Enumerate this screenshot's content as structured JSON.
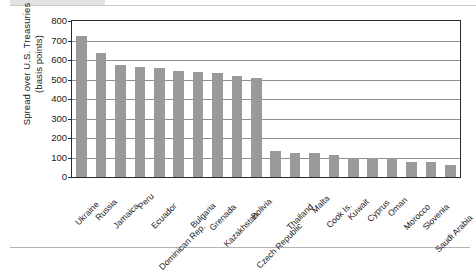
{
  "chart_data": {
    "type": "bar",
    "title": "",
    "subtitle": "",
    "xlabel": "",
    "ylabel": "Spread over U.S. Treasuries\n(basis points)",
    "ylim": [
      0,
      800
    ],
    "ytick_step": 100,
    "yticks": [
      "800",
      "700",
      "600",
      "500",
      "400",
      "300",
      "200",
      "100",
      "0"
    ],
    "grid": true,
    "grid_axis": "y",
    "legend": false,
    "legend_position": "none",
    "bar_color": "#9a9a9a",
    "axis_color": "#2b2b2b",
    "categories": [
      "Ukraine",
      "Russia",
      "Jamaica",
      "Peru",
      "Ecuador",
      "Dominican Rep.",
      "Bulgaria",
      "Grenada",
      "Kazakhstan",
      "Bolivia",
      "Czech Republic",
      "Thailand",
      "Malta",
      "Cook Is.",
      "Kuwait",
      "Cyprus",
      "Oman",
      "Morocco",
      "Slovenia",
      "Saudi Arabia"
    ],
    "values": [
      725,
      635,
      572,
      563,
      558,
      545,
      540,
      531,
      517,
      510,
      133,
      125,
      125,
      113,
      98,
      98,
      98,
      78,
      78,
      60
    ]
  },
  "figure": {
    "decor_top_rule": "",
    "decor_bottom_rule": ""
  }
}
